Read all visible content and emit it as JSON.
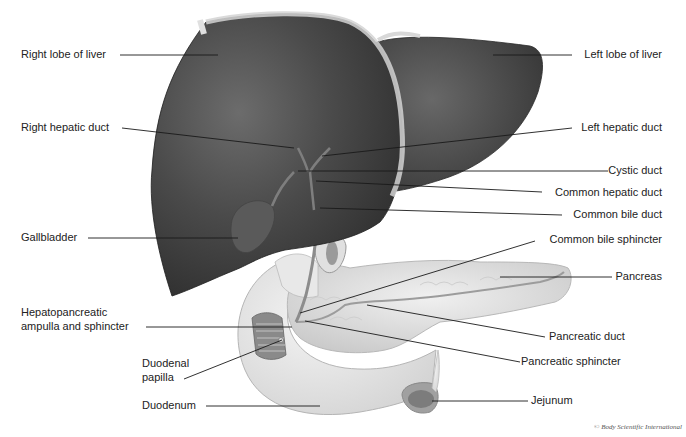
{
  "figure": {
    "copyright": "© Body Scientific International",
    "colors": {
      "liver": "#3e3e3e",
      "liver_highlight": "#6a6a6a",
      "liver_edge": "#cfcfcf",
      "pancreas": "#dcdcdc",
      "duodenum": "#e6e6e6",
      "duct": "#9a9a9a",
      "leader_line": "#1a1a1a",
      "label_text": "#222222"
    },
    "labels_left": [
      {
        "id": "right-lobe-of-liver",
        "text": "Right lobe of liver"
      },
      {
        "id": "right-hepatic-duct",
        "text": "Right hepatic duct"
      },
      {
        "id": "gallbladder",
        "text": "Gallbladder"
      },
      {
        "id": "hepatopancreatic-ampulla-line1",
        "text": "Hepatopancreatic"
      },
      {
        "id": "hepatopancreatic-ampulla-line2",
        "text": "ampulla and sphincter"
      },
      {
        "id": "duodenal-papilla-line1",
        "text": "Duodenal"
      },
      {
        "id": "duodenal-papilla-line2",
        "text": "papilla"
      },
      {
        "id": "duodenum",
        "text": "Duodenum"
      }
    ],
    "labels_right": [
      {
        "id": "left-lobe-of-liver",
        "text": "Left lobe of liver"
      },
      {
        "id": "left-hepatic-duct",
        "text": "Left hepatic duct"
      },
      {
        "id": "cystic-duct",
        "text": "Cystic duct"
      },
      {
        "id": "common-hepatic-duct",
        "text": "Common hepatic duct"
      },
      {
        "id": "common-bile-duct",
        "text": "Common bile duct"
      },
      {
        "id": "common-bile-sphincter",
        "text": "Common bile sphincter"
      },
      {
        "id": "pancreas",
        "text": "Pancreas"
      },
      {
        "id": "pancreatic-duct",
        "text": "Pancreatic duct"
      },
      {
        "id": "pancreatic-sphincter",
        "text": "Pancreatic sphincter"
      },
      {
        "id": "jejunum",
        "text": "Jejunum"
      }
    ]
  }
}
